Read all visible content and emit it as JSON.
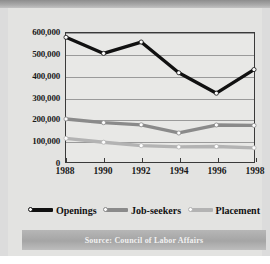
{
  "source": {
    "text": "Source: Council of Labor Affairs"
  },
  "colors": {
    "openings": "#111111",
    "job_seekers": "#8a8a8a",
    "placement": "#b3b3b3",
    "grid": "#9a9a9a",
    "axis": "#3a3a3a",
    "plot_background": "#e8e8e6",
    "card_background": "#e3e3e1",
    "source_band": "#a5a5a5"
  },
  "chart_data": {
    "type": "line",
    "title": "",
    "subtitle": "",
    "xlabel": "",
    "ylabel": "",
    "x": [
      1988,
      1990,
      1992,
      1994,
      1996,
      1998
    ],
    "categories": [
      "1988",
      "1990",
      "1992",
      "1994",
      "1996",
      "1998"
    ],
    "xtick_labels": [
      "1988",
      "1990",
      "1992",
      "1994",
      "1996",
      "1998"
    ],
    "ytick_labels": [
      "0",
      "100,000",
      "200,000",
      "300,000",
      "400,000",
      "500,000",
      "600,000"
    ],
    "ytick_values": [
      0,
      100000,
      200000,
      300000,
      400000,
      500000,
      600000
    ],
    "ylim": [
      0,
      600000
    ],
    "xlim": [
      1988,
      1998
    ],
    "grid": true,
    "legend_position": "bottom",
    "series": [
      {
        "name": "Openings",
        "color": "#111111",
        "marker": "circle",
        "values": [
          580000,
          505000,
          558000,
          415000,
          320000,
          430000
        ]
      },
      {
        "name": "Job-seekers",
        "color": "#8a8a8a",
        "marker": "circle",
        "values": [
          200000,
          183000,
          173000,
          135000,
          172000,
          170000
        ]
      },
      {
        "name": "Placement",
        "color": "#b3b3b3",
        "marker": "circle",
        "values": [
          110000,
          92000,
          76000,
          70000,
          72000,
          66000
        ]
      }
    ]
  }
}
